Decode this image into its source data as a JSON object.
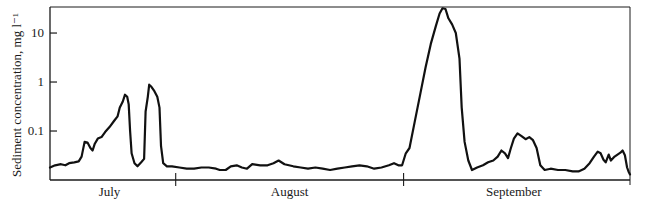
{
  "chart_data": {
    "type": "line",
    "title": "",
    "xlabel": "",
    "ylabel": "Sediment concentration, mg l⁻¹",
    "yscale": "log",
    "ylim": [
      0.01,
      34
    ],
    "y_ticks": [
      {
        "value": 10,
        "label": "10"
      },
      {
        "value": 1,
        "label": "1"
      },
      {
        "value": 0.1,
        "label": "0.1"
      }
    ],
    "x_unit": "days relative to 1 August",
    "xlim": [
      -17.1,
      61.8
    ],
    "month_boundaries": [
      0,
      31
    ],
    "month_labels": [
      {
        "label": "July",
        "center": -9
      },
      {
        "label": "August",
        "center": 15.5
      },
      {
        "label": "September",
        "center": 46
      }
    ],
    "grid": false,
    "legend": "none",
    "series": [
      {
        "name": "Sediment concentration",
        "color": "#111111",
        "points": [
          [
            -17.1,
            0.018
          ],
          [
            -16.4,
            0.02
          ],
          [
            -15.6,
            0.021
          ],
          [
            -15.0,
            0.02
          ],
          [
            -14.5,
            0.022
          ],
          [
            -13.8,
            0.023
          ],
          [
            -13.2,
            0.024
          ],
          [
            -12.8,
            0.03
          ],
          [
            -12.4,
            0.06
          ],
          [
            -12.0,
            0.058
          ],
          [
            -11.6,
            0.045
          ],
          [
            -11.3,
            0.04
          ],
          [
            -11.0,
            0.055
          ],
          [
            -10.6,
            0.07
          ],
          [
            -10.1,
            0.075
          ],
          [
            -9.6,
            0.095
          ],
          [
            -9.0,
            0.12
          ],
          [
            -8.4,
            0.16
          ],
          [
            -7.9,
            0.2
          ],
          [
            -7.6,
            0.3
          ],
          [
            -7.2,
            0.4
          ],
          [
            -6.9,
            0.55
          ],
          [
            -6.6,
            0.5
          ],
          [
            -6.4,
            0.35
          ],
          [
            -6.2,
            0.1
          ],
          [
            -6.0,
            0.035
          ],
          [
            -5.6,
            0.022
          ],
          [
            -5.2,
            0.019
          ],
          [
            -4.7,
            0.023
          ],
          [
            -4.3,
            0.027
          ],
          [
            -4.1,
            0.25
          ],
          [
            -3.8,
            0.5
          ],
          [
            -3.6,
            0.88
          ],
          [
            -3.3,
            0.8
          ],
          [
            -2.9,
            0.65
          ],
          [
            -2.5,
            0.5
          ],
          [
            -2.2,
            0.3
          ],
          [
            -2.0,
            0.05
          ],
          [
            -1.7,
            0.022
          ],
          [
            -1.2,
            0.019
          ],
          [
            -0.5,
            0.019
          ],
          [
            0.5,
            0.018
          ],
          [
            1.5,
            0.017
          ],
          [
            2.5,
            0.017
          ],
          [
            3.5,
            0.018
          ],
          [
            4.5,
            0.018
          ],
          [
            5.5,
            0.017
          ],
          [
            6.0,
            0.016
          ],
          [
            6.8,
            0.016
          ],
          [
            7.5,
            0.019
          ],
          [
            8.3,
            0.02
          ],
          [
            9.0,
            0.018
          ],
          [
            9.7,
            0.017
          ],
          [
            10.4,
            0.021
          ],
          [
            11.5,
            0.02
          ],
          [
            12.5,
            0.02
          ],
          [
            13.3,
            0.022
          ],
          [
            14.0,
            0.025
          ],
          [
            14.8,
            0.021
          ],
          [
            16.0,
            0.019
          ],
          [
            17.0,
            0.018
          ],
          [
            18.0,
            0.017
          ],
          [
            19.0,
            0.018
          ],
          [
            20.0,
            0.017
          ],
          [
            21.0,
            0.016
          ],
          [
            22.0,
            0.017
          ],
          [
            23.0,
            0.018
          ],
          [
            24.0,
            0.019
          ],
          [
            25.0,
            0.02
          ],
          [
            26.0,
            0.019
          ],
          [
            27.0,
            0.017
          ],
          [
            28.0,
            0.018
          ],
          [
            29.0,
            0.02
          ],
          [
            29.7,
            0.022
          ],
          [
            30.3,
            0.02
          ],
          [
            30.8,
            0.02
          ],
          [
            31.3,
            0.035
          ],
          [
            31.8,
            0.045
          ],
          [
            32.5,
            0.15
          ],
          [
            33.3,
            0.6
          ],
          [
            34.0,
            2.0
          ],
          [
            34.7,
            6.0
          ],
          [
            35.4,
            14.0
          ],
          [
            35.9,
            25.0
          ],
          [
            36.3,
            32.0
          ],
          [
            36.7,
            31.0
          ],
          [
            37.1,
            20.0
          ],
          [
            37.6,
            15.0
          ],
          [
            38.1,
            10.0
          ],
          [
            38.6,
            3.0
          ],
          [
            38.9,
            0.3
          ],
          [
            39.3,
            0.06
          ],
          [
            39.8,
            0.025
          ],
          [
            40.3,
            0.016
          ],
          [
            41.0,
            0.018
          ],
          [
            41.8,
            0.02
          ],
          [
            42.5,
            0.023
          ],
          [
            43.2,
            0.025
          ],
          [
            43.8,
            0.03
          ],
          [
            44.3,
            0.04
          ],
          [
            44.8,
            0.035
          ],
          [
            45.2,
            0.028
          ],
          [
            45.6,
            0.045
          ],
          [
            46.0,
            0.07
          ],
          [
            46.5,
            0.09
          ],
          [
            47.0,
            0.08
          ],
          [
            47.6,
            0.068
          ],
          [
            48.1,
            0.075
          ],
          [
            48.6,
            0.065
          ],
          [
            49.1,
            0.045
          ],
          [
            49.6,
            0.02
          ],
          [
            50.2,
            0.016
          ],
          [
            51.0,
            0.017
          ],
          [
            52.0,
            0.016
          ],
          [
            53.0,
            0.016
          ],
          [
            54.0,
            0.015
          ],
          [
            54.8,
            0.015
          ],
          [
            55.6,
            0.017
          ],
          [
            56.3,
            0.022
          ],
          [
            56.9,
            0.03
          ],
          [
            57.4,
            0.038
          ],
          [
            57.8,
            0.035
          ],
          [
            58.2,
            0.026
          ],
          [
            58.5,
            0.023
          ],
          [
            58.9,
            0.033
          ],
          [
            59.2,
            0.025
          ],
          [
            59.7,
            0.03
          ],
          [
            60.1,
            0.033
          ],
          [
            60.5,
            0.036
          ],
          [
            60.8,
            0.04
          ],
          [
            61.1,
            0.032
          ],
          [
            61.4,
            0.018
          ],
          [
            61.6,
            0.015
          ],
          [
            61.8,
            0.013
          ]
        ]
      }
    ]
  }
}
